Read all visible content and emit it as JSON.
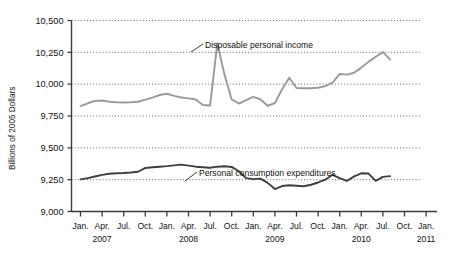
{
  "chart_data": {
    "type": "line",
    "title": "",
    "xlabel": "",
    "ylabel": "Billions of 2005 Dollars",
    "ylim": [
      9000,
      10500
    ],
    "ytick_values": [
      9000,
      9250,
      9500,
      9750,
      10000,
      10250,
      10500
    ],
    "ytick_labels": [
      "9,000",
      "9,250",
      "9,500",
      "9,750",
      "10,000",
      "10,250",
      "10,500"
    ],
    "grid": true,
    "grid_style": "dotted-horizontal",
    "legend_position": "inline-annotations",
    "xtick_labels": [
      "Jan.",
      "Apr.",
      "Jul.",
      "Oct.",
      "Jan.",
      "Apr.",
      "Jul.",
      "Oct.",
      "Jan.",
      "Apr.",
      "Jul.",
      "Oct.",
      "Jan.",
      "Apr.",
      "Jul.",
      "Oct.",
      "Jan."
    ],
    "year_labels": [
      "2007",
      "2008",
      "2009",
      "2010",
      "2011"
    ],
    "x": [
      "2007-01",
      "2007-02",
      "2007-03",
      "2007-04",
      "2007-05",
      "2007-06",
      "2007-07",
      "2007-08",
      "2007-09",
      "2007-10",
      "2007-11",
      "2007-12",
      "2008-01",
      "2008-02",
      "2008-03",
      "2008-04",
      "2008-05",
      "2008-06",
      "2008-07",
      "2008-08",
      "2008-09",
      "2008-10",
      "2008-11",
      "2008-12",
      "2009-01",
      "2009-02",
      "2009-03",
      "2009-04",
      "2009-05",
      "2009-06",
      "2009-07",
      "2009-08",
      "2009-09",
      "2009-10",
      "2009-11",
      "2009-12",
      "2010-01",
      "2010-02",
      "2010-03",
      "2010-04",
      "2010-05",
      "2010-06",
      "2010-07",
      "2010-08"
    ],
    "series": [
      {
        "name": "Disposable personal income",
        "color": "#9a9a9a",
        "values": [
          9828,
          9850,
          9868,
          9872,
          9862,
          9858,
          9856,
          9858,
          9862,
          9878,
          9895,
          9915,
          9925,
          9908,
          9895,
          9888,
          9880,
          9836,
          9833,
          10320,
          10075,
          9880,
          9848,
          9875,
          9900,
          9880,
          9830,
          9852,
          9960,
          10050,
          9970,
          9968,
          9968,
          9972,
          9985,
          10012,
          10080,
          10075,
          10090,
          10130,
          10175,
          10215,
          10252,
          10195
        ]
      },
      {
        "name": "Personal consumption expenditures",
        "color": "#3f3f3f",
        "values": [
          9252,
          9262,
          9275,
          9288,
          9296,
          9300,
          9302,
          9306,
          9312,
          9342,
          9348,
          9352,
          9356,
          9362,
          9368,
          9360,
          9352,
          9348,
          9344,
          9352,
          9355,
          9350,
          9316,
          9262,
          9254,
          9258,
          9225,
          9176,
          9200,
          9206,
          9202,
          9198,
          9210,
          9228,
          9250,
          9288,
          9262,
          9240,
          9276,
          9300,
          9298,
          9240,
          9272,
          9278
        ]
      }
    ],
    "annotations": [
      {
        "name": "disposable-personal-income",
        "text": "Disposable personal income",
        "label_x": 205,
        "label_y": 45,
        "leader_from_x": 203,
        "leader_from_y": 44,
        "leader_to_x": 191,
        "leader_to_y": 52
      },
      {
        "name": "personal-consumption-expenditures",
        "text": "Personal consumption expenditures",
        "label_x": 199,
        "label_y": 173,
        "leader_from_x": 197,
        "leader_from_y": 172,
        "leader_to_x": 185,
        "leader_to_y": 181
      }
    ],
    "colors": {
      "axis": "#3a3a3a",
      "grid": "#555555",
      "background": "#ffffff",
      "income_line": "#9a9a9a",
      "consumption_line": "#3f3f3f"
    }
  }
}
